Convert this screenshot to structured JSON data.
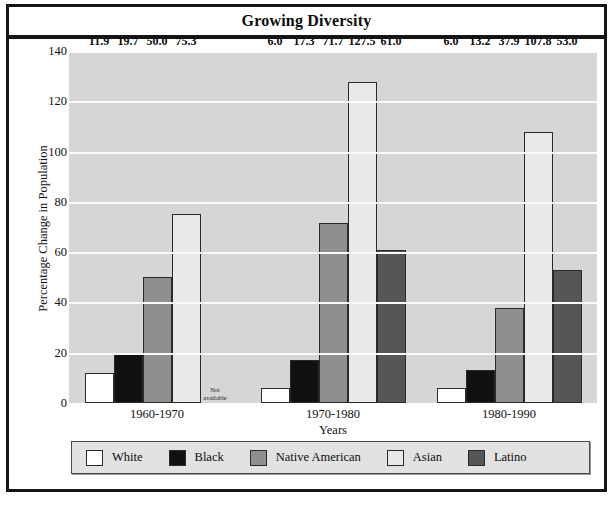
{
  "title": "Growing Diversity",
  "chart_data": {
    "type": "bar",
    "title": "Growing Diversity",
    "xlabel": "Years",
    "ylabel": "Percentage Change in Population",
    "ylim": [
      0,
      140
    ],
    "yticks": [
      0,
      20,
      40,
      60,
      80,
      100,
      120,
      140
    ],
    "grid": true,
    "legend_position": "bottom",
    "categories": [
      "1960-1970",
      "1970-1980",
      "1980-1990"
    ],
    "series": [
      {
        "name": "White",
        "color": "#ffffff",
        "values": [
          11.9,
          6.0,
          6.0
        ],
        "labels": [
          "11.9",
          "6.0",
          "6.0"
        ]
      },
      {
        "name": "Black",
        "color": "#111111",
        "values": [
          19.7,
          17.3,
          13.2
        ],
        "labels": [
          "19.7",
          "17.3",
          "13.2"
        ]
      },
      {
        "name": "Native American",
        "color": "#8f8f8f",
        "values": [
          50.0,
          71.7,
          37.9
        ],
        "labels": [
          "50.0",
          "71.7",
          "37.9"
        ]
      },
      {
        "name": "Asian",
        "color": "#e9e9e9",
        "values": [
          75.3,
          127.5,
          107.8
        ],
        "labels": [
          "75.3",
          "127.5",
          "107.8"
        ]
      },
      {
        "name": "Latino",
        "color": "#565656",
        "values": [
          null,
          61.0,
          53.0
        ],
        "labels": [
          "Not available",
          "61.0",
          "53.0"
        ]
      }
    ],
    "missing_note": {
      "line1": "Not",
      "line2": "available"
    }
  },
  "legend": {
    "items": [
      {
        "label": "White",
        "color": "#ffffff"
      },
      {
        "label": "Black",
        "color": "#111111"
      },
      {
        "label": "Native American",
        "color": "#8f8f8f"
      },
      {
        "label": "Asian",
        "color": "#e9e9e9"
      },
      {
        "label": "Latino",
        "color": "#565656"
      }
    ]
  },
  "colors": {
    "plot_background": "#d6d6d6",
    "gridline": "#fbfbfb",
    "frame": "#151515",
    "legend_background": "#e2e2e2"
  },
  "caption_strip": " "
}
